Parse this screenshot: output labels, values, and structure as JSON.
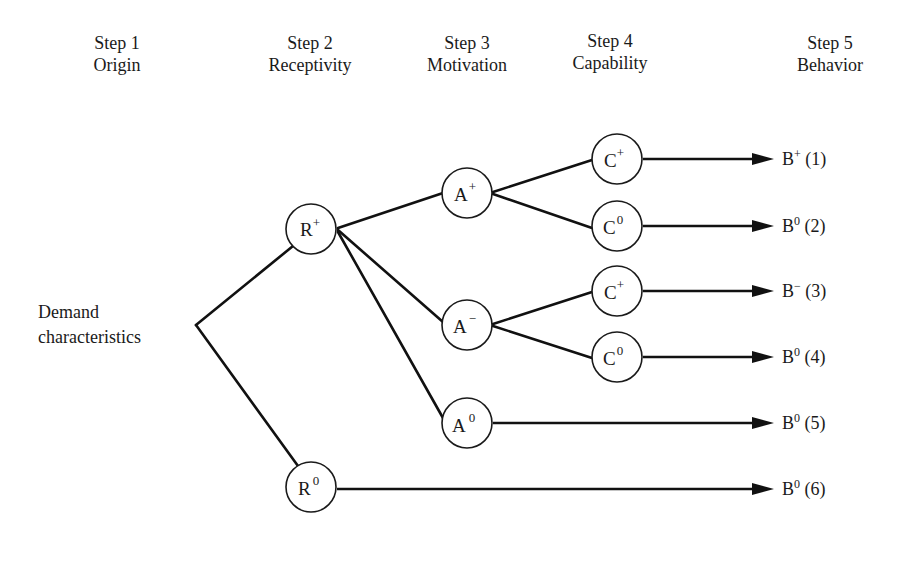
{
  "steps": [
    {
      "step": "Step 1",
      "name": "Origin"
    },
    {
      "step": "Step 2",
      "name": "Receptivity"
    },
    {
      "step": "Step 3",
      "name": "Motivation"
    },
    {
      "step": "Step 4",
      "name": "Capability"
    },
    {
      "step": "Step 5",
      "name": "Behavior"
    }
  ],
  "origin": {
    "line1": "Demand",
    "line2": "characteristics"
  },
  "nodes": {
    "r_plus": {
      "base": "R",
      "sup": "+"
    },
    "r_zero": {
      "base": "R",
      "sup": "0"
    },
    "a_plus": {
      "base": "A",
      "sup": "+"
    },
    "a_minus": {
      "base": "A",
      "sup": "−"
    },
    "a_zero": {
      "base": "A",
      "sup": "0"
    },
    "c_plus_1": {
      "base": "C",
      "sup": "+"
    },
    "c_zero_1": {
      "base": "C",
      "sup": "0"
    },
    "c_plus_2": {
      "base": "C",
      "sup": "+"
    },
    "c_zero_2": {
      "base": "C",
      "sup": "0"
    }
  },
  "outcomes": [
    {
      "base": "B",
      "sup": "+",
      "num": "(1)"
    },
    {
      "base": "B",
      "sup": "0",
      "num": "(2)"
    },
    {
      "base": "B",
      "sup": "−",
      "num": "(3)"
    },
    {
      "base": "B",
      "sup": "0",
      "num": "(4)"
    },
    {
      "base": "B",
      "sup": "0",
      "num": "(5)"
    },
    {
      "base": "B",
      "sup": "0",
      "num": "(6)"
    }
  ]
}
